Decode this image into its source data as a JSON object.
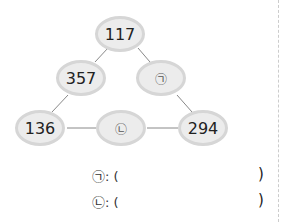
{
  "nodes": {
    "top": "117",
    "left_mid": "357",
    "right_mid": "㉠",
    "bottom_left": "136",
    "bottom_mid": "㉡",
    "bottom_right": "294"
  },
  "answers": [
    {
      "label": "㉠: (",
      "close": ")"
    },
    {
      "label": "㉡: (",
      "close": ")"
    }
  ]
}
